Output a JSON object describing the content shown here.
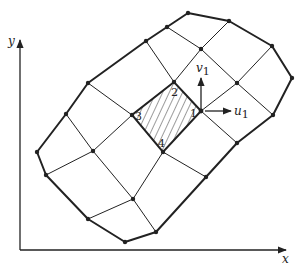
{
  "figure": {
    "axes": {
      "x_label": "x",
      "y_label": "y"
    },
    "element": {
      "node_labels": [
        "1",
        "2",
        "3",
        "4"
      ],
      "hatched": true
    },
    "vectors": {
      "u_label": "u",
      "u_sub": "1",
      "v_label": "v",
      "v_sub": "1"
    },
    "colors": {
      "stroke": "#222222",
      "background": "#ffffff"
    }
  }
}
